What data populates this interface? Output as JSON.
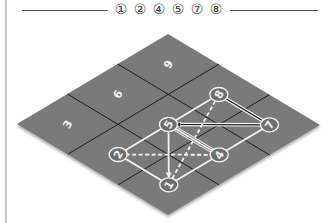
{
  "header": {
    "title": "① ② ④ ⑤ ⑦ ⑧"
  },
  "colors": {
    "board_fill": "#7a7a7a",
    "grid_line": "#1e1e1e",
    "edge_white": "#f4f4f4",
    "node_fill": "#6e6e6e",
    "label_color": "#f2f2f2"
  },
  "board": {
    "vertices": {
      "top": [
        168,
        34
      ],
      "right": [
        320,
        125
      ],
      "bottom": [
        168,
        215
      ],
      "left": [
        17,
        124
      ]
    },
    "grid_size": 3
  },
  "cell_labels": [
    {
      "text": "9",
      "u": 0.1667,
      "v": 0.1667
    },
    {
      "text": "6",
      "u": 0.1667,
      "v": 0.5
    },
    {
      "text": "3",
      "u": 0.1667,
      "v": 0.8333
    }
  ],
  "nodes": [
    {
      "id": "8",
      "label": "8",
      "u": 0.5,
      "v": 0.1667
    },
    {
      "id": "7",
      "label": "7",
      "u": 0.8333,
      "v": 0.1667
    },
    {
      "id": "5",
      "label": "5",
      "u": 0.5,
      "v": 0.5
    },
    {
      "id": "4",
      "label": "4",
      "u": 0.8333,
      "v": 0.5
    },
    {
      "id": "2",
      "label": "2",
      "u": 0.5,
      "v": 0.8333
    },
    {
      "id": "1",
      "label": "1",
      "u": 0.8333,
      "v": 0.8333
    }
  ],
  "edges": [
    {
      "from": "5",
      "to": "8",
      "style": "solid"
    },
    {
      "from": "8",
      "to": "7",
      "style": "double"
    },
    {
      "from": "7",
      "to": "5",
      "style": "double-arrow"
    },
    {
      "from": "8",
      "to": "1",
      "style": "dashed"
    },
    {
      "from": "5",
      "to": "1",
      "style": "arrow"
    },
    {
      "from": "2",
      "to": "4",
      "style": "dashed"
    },
    {
      "from": "5",
      "to": "4",
      "style": "triple"
    },
    {
      "from": "2",
      "to": "5",
      "style": "solid"
    },
    {
      "from": "2",
      "to": "1",
      "style": "solid"
    },
    {
      "from": "1",
      "to": "4",
      "style": "solid"
    },
    {
      "from": "4",
      "to": "7",
      "style": "solid"
    }
  ]
}
